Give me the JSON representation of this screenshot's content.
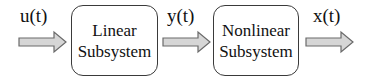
{
  "diagram": {
    "type": "block-diagram",
    "signals": {
      "input": "u(t)",
      "intermediate": "y(t)",
      "output": "x(t)"
    },
    "blocks": [
      {
        "line1": "Linear",
        "line2": "Subsystem"
      },
      {
        "line1": "Nonlinear",
        "line2": "Subsystem"
      }
    ],
    "colors": {
      "arrow_fill": "#d6d6d6",
      "arrow_stroke": "#6a6a6a",
      "box_border": "#3a3a3a"
    }
  }
}
